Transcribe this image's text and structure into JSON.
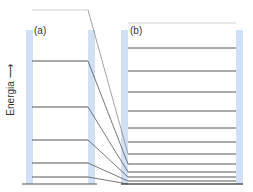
{
  "axis": {
    "label": "Energia ⟶"
  },
  "panels": [
    {
      "id": "a",
      "label": "(a)"
    },
    {
      "id": "b",
      "label": "(b)"
    }
  ],
  "colors": {
    "bar": "#c9dbf2",
    "line": "#555555",
    "faint_line": "#cfcfcf"
  },
  "diagram": {
    "left_panel": {
      "x1": 32,
      "x2": 88,
      "bar_left_x": 26,
      "bar_right_x": 88,
      "bar_width": 7,
      "top_faint_y": 10,
      "levels_y": [
        61,
        107,
        140,
        163,
        177
      ],
      "bottom_y": 184
    },
    "right_panel": {
      "x1": 128,
      "x2": 236,
      "bar_left_x": 121,
      "bar_right_x": 236,
      "bar_width": 7,
      "top_faint_y": 23,
      "levels_y": [
        48,
        71,
        92,
        111,
        128,
        142,
        154,
        164,
        172,
        177,
        181
      ],
      "bottom_y": 184
    },
    "connections": [
      {
        "from_y": 10,
        "to_y": 154
      },
      {
        "from_y": 61,
        "to_y": 164
      },
      {
        "from_y": 107,
        "to_y": 172
      },
      {
        "from_y": 140,
        "to_y": 177
      },
      {
        "from_y": 163,
        "to_y": 181
      },
      {
        "from_y": 177,
        "to_y": 184
      }
    ]
  }
}
